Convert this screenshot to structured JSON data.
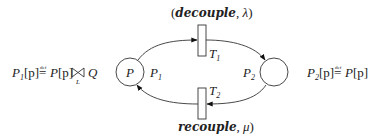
{
  "diagram": {
    "type": "petri-net",
    "places": [
      {
        "id": "P1",
        "inner_label": "P",
        "side_label": "P",
        "side_label_sub": "1"
      },
      {
        "id": "P2",
        "inner_label": "",
        "side_label": "P",
        "side_label_sub": "2"
      }
    ],
    "transitions": [
      {
        "id": "T1",
        "label": "T",
        "label_sub": "1",
        "action_open": "(",
        "action_name": "decouple",
        "action_sep": ", ",
        "action_rate": "λ",
        "action_close": ")"
      },
      {
        "id": "T2",
        "label": "T",
        "label_sub": "2",
        "action_open": "",
        "action_name": "recouple",
        "action_sep": ", ",
        "action_rate": "μ",
        "action_close": ")"
      }
    ],
    "arcs": [
      {
        "from": "P1",
        "to": "T1"
      },
      {
        "from": "T1",
        "to": "P2"
      },
      {
        "from": "P2",
        "to": "T2"
      },
      {
        "from": "T2",
        "to": "P1"
      }
    ],
    "definitions": {
      "left": {
        "lhs": "P",
        "lhs_sub": "1",
        "lhs_arg": "[p]",
        "defsym": "≝",
        "def_small": "def",
        "eq": "=",
        "rhs_proc": "P",
        "rhs_arg": "[p]",
        "coop_symbol": "⋈",
        "coop_set": "L",
        "rhs_other": "Q"
      },
      "right": {
        "lhs": "P",
        "lhs_sub": "2",
        "lhs_arg": "[p]",
        "def_small": "def",
        "eq": "=",
        "rhs_proc": "P",
        "rhs_arg": "[p]"
      }
    }
  }
}
